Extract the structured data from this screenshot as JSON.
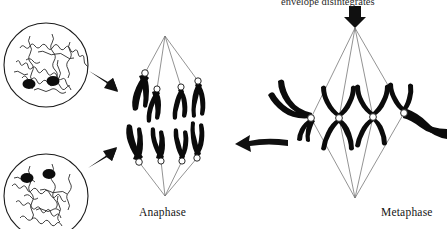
{
  "figure": {
    "background_color": "#ffffff",
    "ink_color": "#000000",
    "spindle_fiber_color": "#6b6b6b",
    "centromere_fill": "#ffffff",
    "width": 447,
    "height": 229
  },
  "annotations": {
    "envelope_caption": "envelope disintegrates",
    "anaphase_label": "Anaphase",
    "metaphase_label": "Metaphase"
  },
  "stages": [
    {
      "id": "metaphase",
      "label": "Metaphase",
      "description": "Chromosomes aligned at the spindle equator",
      "chromosome_count": 4,
      "chromosome_shape": "X-shaped paired chromatids",
      "pole_top": {
        "x": 355,
        "y": 28
      },
      "pole_bottom": {
        "x": 355,
        "y": 198
      }
    },
    {
      "id": "anaphase",
      "label": "Anaphase",
      "description": "Sister chromatids pulled to opposite poles",
      "chromosome_count": 8,
      "chromosome_shape": "V-shaped separated chromatids",
      "pole_top": {
        "x": 165,
        "y": 36
      },
      "pole_bottom": {
        "x": 165,
        "y": 196
      }
    },
    {
      "id": "telophase-upper",
      "label": "Daughter nucleus (upper)",
      "description": "Reformed nucleus with decondensed chromatin",
      "nucleoli_count": 2
    },
    {
      "id": "telophase-lower",
      "label": "Daughter nucleus (lower)",
      "description": "Reformed nucleus with decondensed chromatin",
      "nucleoli_count": 2
    }
  ],
  "arrows": [
    {
      "id": "envelope-arrow",
      "direction": "down",
      "points_to": "metaphase spindle pole"
    },
    {
      "id": "metaphase-to-anaphase-arrow",
      "direction": "left",
      "points_to": "anaphase"
    },
    {
      "id": "anaphase-to-upper-nucleus-arrow",
      "direction": "up-left",
      "points_to": "upper daughter nucleus"
    },
    {
      "id": "anaphase-to-lower-nucleus-arrow",
      "direction": "down-left",
      "points_to": "lower daughter nucleus"
    }
  ]
}
